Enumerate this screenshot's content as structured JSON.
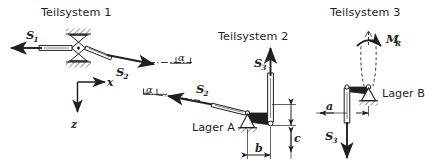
{
  "figure": {
    "type": "free-body-diagram",
    "background_color": "#ffffff",
    "ink_color": "#231f20"
  },
  "subsystems": [
    {
      "id": "ts1",
      "title": "Teilsystem 1"
    },
    {
      "id": "ts2",
      "title": "Teilsystem 2"
    },
    {
      "id": "ts3",
      "title": "Teilsystem 3"
    }
  ],
  "coordinate_system": {
    "x_label": "x",
    "z_label": "z",
    "x_direction": "right",
    "z_direction": "down"
  },
  "forces": [
    {
      "name": "S1",
      "symbol": "S",
      "subscript": "1",
      "subsystem": "ts1",
      "direction": "left"
    },
    {
      "name": "S2-ts1",
      "symbol": "S",
      "subscript": "2",
      "subsystem": "ts1",
      "direction": "down-right"
    },
    {
      "name": "S2-ts2",
      "symbol": "S",
      "subscript": "2",
      "subsystem": "ts2",
      "direction": "up-left"
    },
    {
      "name": "S3-ts2",
      "symbol": "S",
      "subscript": "3",
      "subsystem": "ts2",
      "direction": "up"
    },
    {
      "name": "S3-ts3",
      "symbol": "S",
      "subscript": "3",
      "subsystem": "ts3",
      "direction": "down"
    }
  ],
  "moments": [
    {
      "name": "MR",
      "symbol": "M",
      "subscript": "R",
      "subsystem": "ts3",
      "sense": "counter-clockwise"
    }
  ],
  "angles": [
    {
      "name": "alpha-ts1",
      "label": "α",
      "subsystem": "ts1"
    },
    {
      "name": "alpha-ts2",
      "label": "α",
      "subsystem": "ts2"
    }
  ],
  "bearings": [
    {
      "name": "lager-a",
      "label": "Lager A",
      "subsystem": "ts2",
      "type": "pinned"
    },
    {
      "name": "lager-b",
      "label": "Lager B",
      "subsystem": "ts3",
      "type": "pinned"
    }
  ],
  "dimensions": [
    {
      "name": "b",
      "label": "b",
      "subsystem": "ts2",
      "orientation": "horizontal"
    },
    {
      "name": "c",
      "label": "c",
      "subsystem": "ts2",
      "orientation": "vertical"
    },
    {
      "name": "a",
      "label": "a",
      "subsystem": "ts3",
      "orientation": "horizontal"
    }
  ]
}
